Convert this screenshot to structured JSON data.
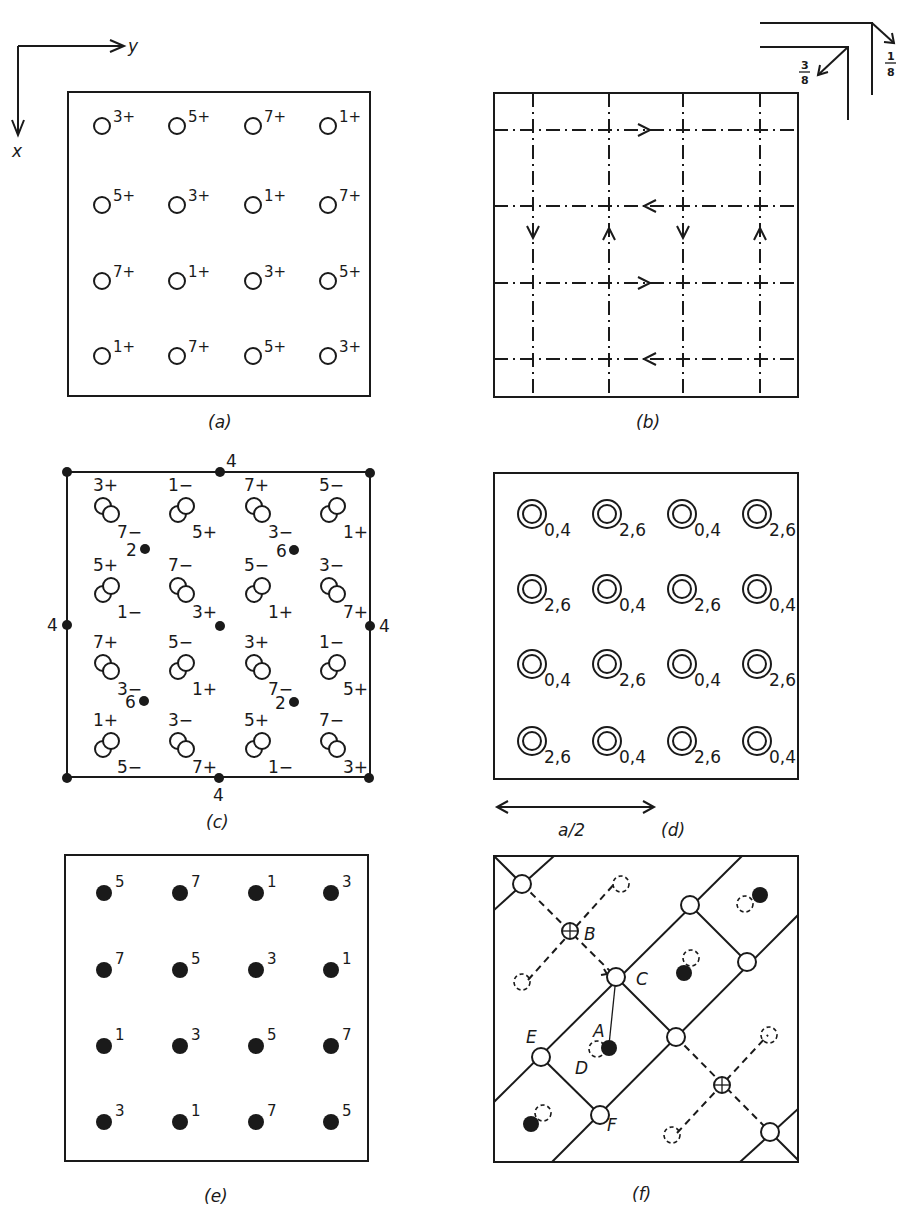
{
  "axes": {
    "x_label": "x",
    "y_label": "y"
  },
  "glide_legend": {
    "upper": "1/8",
    "lower": "3/8",
    "upper_num": "1",
    "upper_den": "8",
    "lower_num": "3",
    "lower_den": "8"
  },
  "panels": {
    "a": {
      "caption": "(a)",
      "grid": [
        [
          "3+",
          "5+",
          "7+",
          "1+"
        ],
        [
          "5+",
          "3+",
          "1+",
          "7+"
        ],
        [
          "7+",
          "1+",
          "3+",
          "5+"
        ],
        [
          "1+",
          "7+",
          "5+",
          "3+"
        ]
      ]
    },
    "b": {
      "caption": "(b)"
    },
    "c": {
      "caption": "(c)",
      "axis_labels": {
        "top": "4",
        "bottom": "4",
        "left": "4",
        "right": "4"
      },
      "twofold_labels": [
        "2",
        "6",
        "6",
        "2"
      ],
      "pairs": [
        [
          "3+",
          "7-"
        ],
        [
          "1-",
          "5+"
        ],
        [
          "7+",
          "3-"
        ],
        [
          "5-",
          "1+"
        ],
        [
          "5+",
          "1-"
        ],
        [
          "7-",
          "3+"
        ],
        [
          "5-",
          "1+"
        ],
        [
          "3-",
          "7+"
        ],
        [
          "7+",
          "3-"
        ],
        [
          "5-",
          "1+"
        ],
        [
          "3+",
          "7-"
        ],
        [
          "1-",
          "5+"
        ],
        [
          "1+",
          "5-"
        ],
        [
          "3-",
          "7+"
        ],
        [
          "5+",
          "1-"
        ],
        [
          "7-",
          "3+"
        ]
      ]
    },
    "d": {
      "caption": "(d)",
      "scale_label": "a/2",
      "grid": [
        [
          "0,4",
          "2,6",
          "0,4",
          "2,6"
        ],
        [
          "2,6",
          "0,4",
          "2,6",
          "0,4"
        ],
        [
          "0,4",
          "2,6",
          "0,4",
          "2,6"
        ],
        [
          "2,6",
          "0,4",
          "2,6",
          "0,4"
        ]
      ]
    },
    "e": {
      "caption": "(e)",
      "grid": [
        [
          "5",
          "7",
          "1",
          "3"
        ],
        [
          "7",
          "5",
          "3",
          "1"
        ],
        [
          "1",
          "3",
          "5",
          "7"
        ],
        [
          "3",
          "1",
          "7",
          "5"
        ]
      ]
    },
    "f": {
      "caption": "(f)",
      "labels": {
        "A": "A",
        "B": "B",
        "C": "C",
        "D": "D",
        "E": "E",
        "F": "F"
      }
    }
  }
}
